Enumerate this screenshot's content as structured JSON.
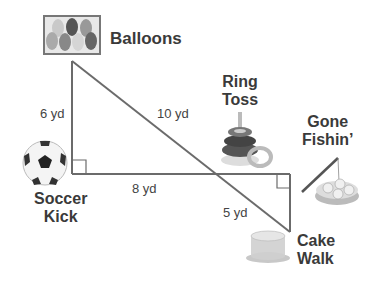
{
  "stations": {
    "balloons": {
      "label": "Balloons"
    },
    "ring_toss": {
      "line1": "Ring",
      "line2": "Toss"
    },
    "gone_fishin": {
      "line1": "Gone",
      "line2": "Fishin’"
    },
    "soccer_kick": {
      "line1": "Soccer",
      "line2": "Kick"
    },
    "cake_walk": {
      "line1": "Cake",
      "line2": "Walk"
    }
  },
  "measurements": {
    "balloons_to_soccer": "6 yd",
    "balloons_to_cake": "10 yd",
    "soccer_to_right": "8 yd",
    "right_to_cake": "5 yd"
  },
  "colors": {
    "line": "#6b6b6b",
    "text": "#3a3a3a"
  }
}
